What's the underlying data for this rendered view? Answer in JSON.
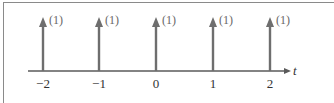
{
  "diagram": {
    "type": "impulse-train",
    "axis": {
      "label": "t",
      "color": "#5a5a5a"
    },
    "impulse_color": "#6e6e6e",
    "impulses": [
      {
        "t": "−2",
        "weight": "(1)"
      },
      {
        "t": "−1",
        "weight": "(1)"
      },
      {
        "t": "0",
        "weight": "(1)"
      },
      {
        "t": "1",
        "weight": "(1)"
      },
      {
        "t": "2",
        "weight": "(1)"
      }
    ]
  }
}
